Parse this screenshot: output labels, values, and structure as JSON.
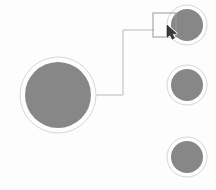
{
  "canvas": {
    "width": 216,
    "height": 190,
    "background_color": "#fdfdfd",
    "label": "node-graph-canvas"
  },
  "palette": {
    "node_fill": "#878787",
    "node_ring": "#d6d6d6",
    "node_gap": "#ffffff",
    "connector": "#b9b9b9",
    "selection_outline": "#9a9a9a",
    "cursor_fill": "#3a3a3a",
    "cursor_outline": "#ffffff"
  },
  "nodes": [
    {
      "id": "node-root",
      "name": "root-node",
      "cx": 58,
      "cy": 95,
      "fill_radius": 33,
      "ring_radius": 38,
      "selected": false,
      "label": ""
    },
    {
      "id": "node-child-1",
      "name": "child-node-1",
      "cx": 187,
      "cy": 25,
      "fill_radius": 16,
      "ring_radius": 20,
      "selected": true,
      "label": ""
    },
    {
      "id": "node-child-2",
      "name": "child-node-2",
      "cx": 187,
      "cy": 85,
      "fill_radius": 16,
      "ring_radius": 20,
      "selected": false,
      "label": ""
    },
    {
      "id": "node-child-3",
      "name": "child-node-3",
      "cx": 187,
      "cy": 157,
      "fill_radius": 16,
      "ring_radius": 20,
      "selected": false,
      "label": ""
    }
  ],
  "connectors": [
    {
      "id": "connector-root-to-child-1",
      "name": "connector-root-to-child-1",
      "from": "node-root",
      "to": "node-child-1",
      "points": "96,95 123,95 123,30 154,30",
      "stroke_width": 1
    }
  ],
  "selection": {
    "name": "selection-rectangle",
    "target": "node-child-1",
    "x": 153,
    "y": 13,
    "width": 23,
    "height": 24,
    "stroke_width": 1
  },
  "cursor": {
    "name": "mouse-cursor",
    "type": "arrow-pointer",
    "x": 167,
    "y": 25,
    "points": "0,0 0,12.5 3.1,9.7 5.2,14.2 7.4,13.1 5.3,8.8 9.4,8.5"
  }
}
